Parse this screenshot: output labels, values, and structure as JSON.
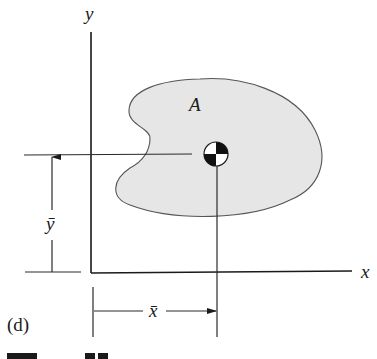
{
  "figure": {
    "part_label": "(d)",
    "caption_partial": "Figure 7.6"
  },
  "axes": {
    "x_label": "x",
    "y_label": "y"
  },
  "region": {
    "label": "A",
    "fill_color": "#e6e6e6",
    "outline_color": "#555555"
  },
  "centroid": {
    "symbol": "centroid-marker",
    "x_dim_label": "x̄",
    "y_dim_label": "ȳ"
  }
}
